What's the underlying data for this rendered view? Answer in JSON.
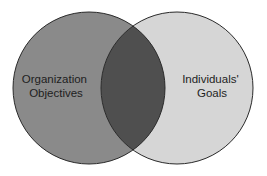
{
  "diagram": {
    "type": "venn",
    "sets": [
      {
        "label_lines": [
          "Organization",
          "Objectives"
        ],
        "fill": "#8a8a8a"
      },
      {
        "label_lines": [
          "Individuals'",
          "Goals"
        ],
        "fill": "#d6d6d6"
      }
    ],
    "intersection_fill": "#4f4f4f",
    "stroke": "#2a2a2a"
  }
}
